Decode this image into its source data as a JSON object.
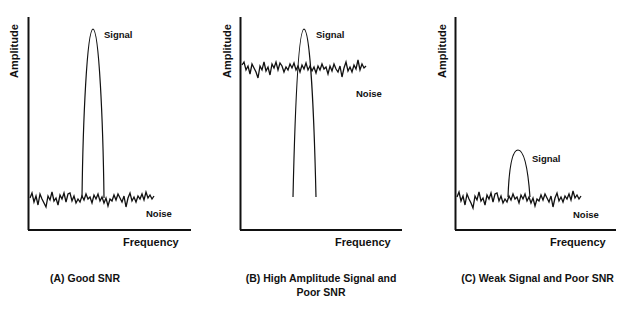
{
  "panels": [
    {
      "id": "A",
      "caption": "(A) Good SNR",
      "y_label": "Amplitude",
      "x_label": "Frequency",
      "signal_label": "Signal",
      "noise_label": "Noise"
    },
    {
      "id": "B",
      "caption_line1": "(B) High Amplitude Signal and",
      "caption_line2": "Poor SNR",
      "y_label": "Amplitude",
      "x_label": "Frequency",
      "signal_label": "Signal",
      "noise_label": "Noise"
    },
    {
      "id": "C",
      "caption": "(C) Weak Signal and Poor SNR",
      "y_label": "Amplitude",
      "x_label": "Frequency",
      "signal_label": "Signal",
      "noise_label": "Noise"
    }
  ],
  "colors": {
    "line": "#111111",
    "background": "#ffffff"
  }
}
